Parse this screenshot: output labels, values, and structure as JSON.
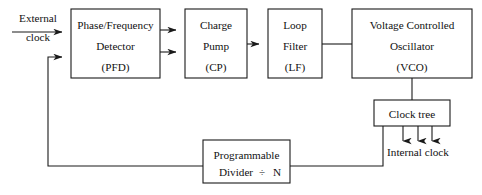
{
  "diagram": {
    "canvas": {
      "width": 482,
      "height": 195
    },
    "colors": {
      "background": "#ffffff",
      "stroke": "#1a1a1a",
      "text": "#111111"
    },
    "blocks": {
      "pfd": {
        "name": "Phase/Frequency Detector",
        "line1": "Phase/Frequency",
        "line2": "Detector",
        "line3": "(PFD)",
        "x": 71,
        "y": 9,
        "w": 89,
        "h": 69
      },
      "cp": {
        "name": "Charge Pump",
        "line1": "Charge",
        "line2": "Pump",
        "line3": "(CP)",
        "x": 185,
        "y": 9,
        "w": 62,
        "h": 69
      },
      "lf": {
        "name": "Loop Filter",
        "line1": "Loop",
        "line2": "Filter",
        "line3": "(LF)",
        "x": 268,
        "y": 9,
        "w": 54,
        "h": 69
      },
      "vco": {
        "name": "Voltage Controlled Oscillator",
        "line1": "Voltage Controlled",
        "line2": "Oscillator",
        "line3": "(VCO)",
        "x": 352,
        "y": 9,
        "w": 120,
        "h": 69
      },
      "clock_tree": {
        "name": "Clock tree",
        "line1": "Clock tree",
        "x": 374,
        "y": 100,
        "w": 76,
        "h": 26
      },
      "divider": {
        "name": "Programmable Divider",
        "line1": "Programmable",
        "line2a": "Divider",
        "divide_symbol": "÷",
        "line2b": "N",
        "x": 203,
        "y": 140,
        "w": 87,
        "h": 43
      }
    },
    "labels": {
      "external_clock_line1": "External",
      "external_clock_line2": "clock",
      "internal_clock": "Internal clock"
    },
    "connections": [
      {
        "name": "external-clock-to-pfd",
        "from": "External clock",
        "to": "PFD",
        "arrow": true
      },
      {
        "name": "feedback-to-pfd",
        "from": "Programmable Divider",
        "to": "PFD",
        "arrow": true
      },
      {
        "name": "pfd-to-cp-up",
        "from": "PFD",
        "to": "Charge Pump",
        "arrow": true
      },
      {
        "name": "pfd-to-cp-down",
        "from": "PFD",
        "to": "Charge Pump",
        "arrow": true
      },
      {
        "name": "cp-to-lf",
        "from": "Charge Pump",
        "to": "Loop Filter",
        "arrow": true
      },
      {
        "name": "lf-to-vco",
        "from": "Loop Filter",
        "to": "VCO",
        "arrow": false
      },
      {
        "name": "vco-to-clock-tree",
        "from": "VCO",
        "to": "Clock tree",
        "arrow": false
      },
      {
        "name": "clock-tree-to-internal-clock",
        "from": "Clock tree",
        "to": "Internal clock",
        "arrow": true,
        "count": 3
      },
      {
        "name": "clock-tree-to-divider",
        "from": "Clock tree",
        "to": "Programmable Divider",
        "arrow": false
      }
    ]
  }
}
